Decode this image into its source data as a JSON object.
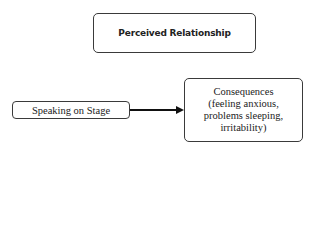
{
  "diagram": {
    "type": "flowchart",
    "nodes": {
      "top": {
        "label": "Perceived Relationship"
      },
      "left": {
        "label": "Speaking on Stage"
      },
      "right": {
        "lines": [
          "Consequences",
          "(feeling anxious,",
          "problems sleeping,",
          "irritability)"
        ]
      }
    },
    "edges": [
      {
        "from": "Speaking on Stage",
        "to": "Consequences (feeling anxious, problems sleeping, irritability)",
        "style": "solid-arrow"
      }
    ],
    "colors": {
      "border": "#3a3a3a",
      "text": "#222222",
      "arrow": "#111111",
      "background": "#ffffff"
    }
  }
}
